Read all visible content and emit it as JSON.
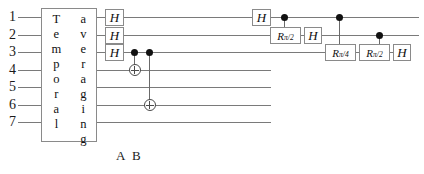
{
  "diagram": {
    "wires": [
      {
        "id": 1,
        "label": "1",
        "y": 17,
        "x_start": 18,
        "x_end": 419
      },
      {
        "id": 2,
        "label": "2",
        "y": 35,
        "x_start": 18,
        "x_end": 419
      },
      {
        "id": 3,
        "label": "3",
        "y": 52,
        "x_start": 18,
        "x_end": 411
      },
      {
        "id": 4,
        "label": "4",
        "y": 70,
        "x_start": 18,
        "x_end": 271
      },
      {
        "id": 5,
        "label": "5",
        "y": 87,
        "x_start": 18,
        "x_end": 271
      },
      {
        "id": 6,
        "label": "6",
        "y": 105,
        "x_start": 18,
        "x_end": 271
      },
      {
        "id": 7,
        "label": "7",
        "y": 122,
        "x_start": 18,
        "x_end": 271
      }
    ],
    "temporal_averaging_box": {
      "left_word": "Temporal",
      "right_word": "averaging",
      "x": 41,
      "y": 8,
      "width": 56,
      "height": 134
    },
    "gates": [
      {
        "name": "H",
        "label": "H",
        "wire": 1,
        "x": 105,
        "width": 19,
        "height": 17
      },
      {
        "name": "H",
        "label": "H",
        "wire": 2,
        "x": 105,
        "width": 19,
        "height": 17
      },
      {
        "name": "H",
        "label": "H",
        "wire": 3,
        "x": 105,
        "width": 19,
        "height": 17
      },
      {
        "name": "H",
        "label": "H",
        "wire": 1,
        "x": 252,
        "width": 19,
        "height": 17
      },
      {
        "name": "Rpi2",
        "label": "R",
        "sub": "π/2",
        "wire": 2,
        "x": 270,
        "width": 31,
        "height": 17
      },
      {
        "name": "H",
        "label": "H",
        "wire": 2,
        "x": 304,
        "width": 18,
        "height": 17
      },
      {
        "name": "Rpi4",
        "label": "R",
        "sub": "π/4",
        "wire": 3,
        "x": 325,
        "width": 31,
        "height": 17
      },
      {
        "name": "Rpi2",
        "label": "R",
        "sub": "π/2",
        "wire": 3,
        "x": 359,
        "width": 31,
        "height": 17
      },
      {
        "name": "H",
        "label": "H",
        "wire": 3,
        "x": 393,
        "width": 18,
        "height": 17
      }
    ],
    "cnots": [
      {
        "name": "A",
        "control_wire": 3,
        "target_wire": 4,
        "x": 131
      },
      {
        "name": "B",
        "control_wire": 3,
        "target_wire": 6,
        "x": 146
      }
    ],
    "controlled_rotations": [
      {
        "control_wire": 1,
        "target_wire": 2,
        "x": 281
      },
      {
        "control_wire": 1,
        "target_wire": 3,
        "x": 336
      },
      {
        "control_wire": 2,
        "target_wire": 3,
        "x": 376
      }
    ],
    "markers": [
      {
        "label": "A",
        "x": 116,
        "y": 148
      },
      {
        "label": "B",
        "x": 132,
        "y": 148
      }
    ],
    "colors": {
      "wire": "#7a7a7a",
      "gate_border": "#8a8a8a",
      "text": "#111111",
      "background": "#ffffff"
    }
  }
}
